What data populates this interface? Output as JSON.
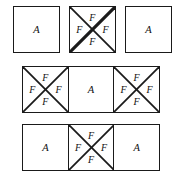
{
  "figure": {
    "width": 183,
    "height": 181,
    "background_color": "#ffffff",
    "stroke_color": "#1a1a1a",
    "text_color": "#111111",
    "labels": {
      "A": "A",
      "F": "F"
    },
    "rows": [
      {
        "name": "row-1",
        "arrangement": "spaced",
        "top": 6,
        "left": 13,
        "cell_size": 47,
        "cells": [
          {
            "name": "cell-r1c1",
            "type": "plain",
            "center": "A"
          },
          {
            "name": "cell-r1c2",
            "type": "crossed",
            "top": "F",
            "left": "F",
            "right": "F",
            "bottom": "F"
          },
          {
            "name": "cell-r1c3",
            "type": "plain",
            "center": "A"
          }
        ]
      },
      {
        "name": "row-2",
        "arrangement": "strip",
        "top": 66,
        "left": 22,
        "cell_size": 47,
        "cells": [
          {
            "name": "cell-r2c1",
            "type": "crossed",
            "top": "F",
            "left": "F",
            "right": "F",
            "bottom": "F"
          },
          {
            "name": "cell-r2c2",
            "type": "plain",
            "center": "A"
          },
          {
            "name": "cell-r2c3",
            "type": "crossed",
            "top": "F",
            "left": "F",
            "right": "F",
            "bottom": "F"
          }
        ]
      },
      {
        "name": "row-3",
        "arrangement": "strip",
        "top": 124,
        "left": 22,
        "cell_size": 47,
        "cells": [
          {
            "name": "cell-r3c1",
            "type": "plain",
            "center": "A"
          },
          {
            "name": "cell-r3c2",
            "type": "crossed",
            "top": "F",
            "left": "F",
            "right": "F",
            "bottom": "F"
          },
          {
            "name": "cell-r3c3",
            "type": "plain",
            "center": "A"
          }
        ]
      }
    ]
  }
}
